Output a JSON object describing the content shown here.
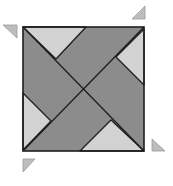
{
  "diagram": {
    "type": "geometric-tiling-puzzle",
    "colors": {
      "background": "#ffffff",
      "dark_fill": "#8c8c8c",
      "light_fill": "#d2d2d2",
      "stroke": "#1e1e1e",
      "small_triangle_fill": "#bdbdbd",
      "small_triangle_stroke": "#9a9a9a"
    },
    "square": {
      "x": 23,
      "y": 27,
      "width": 121,
      "height": 124
    },
    "light_triangles": [
      {
        "name": "top",
        "points": "23,27 86,27 56,59"
      },
      {
        "name": "right",
        "points": "144,29 144,85 116,57"
      },
      {
        "name": "bottom",
        "points": "80,151 144,151 111,120"
      },
      {
        "name": "left",
        "points": "23,93 23,150 51,121"
      }
    ],
    "lines": [
      {
        "name": "diagonal-main",
        "x1": 23,
        "y1": 27,
        "x2": 144,
        "y2": 151
      },
      {
        "name": "diagonal-anti",
        "x1": 144,
        "y1": 27,
        "x2": 23,
        "y2": 151
      }
    ],
    "small_triangles": [
      {
        "name": "top-left",
        "points": "3,25 17,25 17,38"
      },
      {
        "name": "top-right",
        "points": "132,19 145,6 145,19"
      },
      {
        "name": "bottom-right",
        "points": "152,139 152,151 165,151"
      },
      {
        "name": "bottom-left",
        "points": "23,159 35,159 23,172"
      }
    ]
  }
}
